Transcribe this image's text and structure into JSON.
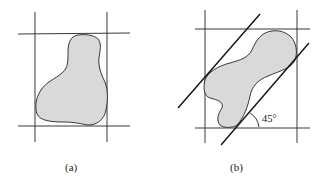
{
  "figure": {
    "panels": [
      {
        "id": "a",
        "label": "(a)",
        "description": "Irregular blob enclosed by axis-aligned bounding lines",
        "bounding_lines": {
          "vertical": [
            35,
            107
          ],
          "horizontal": [
            34,
            126
          ]
        }
      },
      {
        "id": "b",
        "label": "(b)",
        "description": "Irregular blob with axis-aligned bounding lines and 45-degree tangent lines",
        "bounding_lines": {
          "vertical": [
            205,
            297
          ],
          "horizontal": [
            29,
            128
          ]
        },
        "diagonal_angle_label": "45°"
      }
    ],
    "colors": {
      "line": "#222222",
      "fill": "#d9d9d9"
    }
  }
}
